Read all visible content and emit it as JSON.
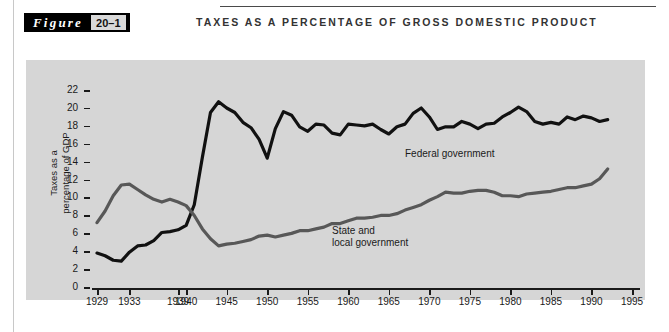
{
  "figure": {
    "word": "Figure",
    "number": "20–1",
    "title": "TAXES AS A PERCENTAGE OF GROSS DOMESTIC PRODUCT"
  },
  "colors": {
    "panel_background": "#d6d6d6",
    "federal_line": "#111111",
    "state_local_line": "#585858",
    "axis": "#1a1a1a",
    "tag_background": "#000000",
    "tag_number_background": "#d9d9d9"
  },
  "chart_data": {
    "type": "line",
    "title": "Taxes as a Percentage of Gross Domestic Product",
    "xlabel": "",
    "ylabel": "Taxes as a percentage of GDP",
    "ylabel_lines": [
      "Taxes as a",
      "percentage of GDP"
    ],
    "xlim": [
      1929,
      1995
    ],
    "ylim": [
      0,
      22
    ],
    "ytick_values": [
      0,
      2,
      4,
      6,
      8,
      10,
      12,
      14,
      16,
      18,
      20,
      22
    ],
    "ytick_labels": [
      "0",
      "2",
      "4",
      "6",
      "8",
      "10",
      "12",
      "14",
      "16",
      "18",
      "20",
      "22"
    ],
    "xtick_values": [
      1929,
      1933,
      1939,
      1940,
      1945,
      1950,
      1955,
      1960,
      1965,
      1970,
      1975,
      1980,
      1985,
      1990,
      1995
    ],
    "xtick_labels": [
      "1929",
      "1933",
      "1939",
      "1940",
      "1945",
      "1950",
      "1955",
      "1960",
      "1965",
      "1970",
      "1975",
      "1980",
      "1985",
      "1990",
      "1995"
    ],
    "grid": false,
    "legend_position": "inline-annotation",
    "series": [
      {
        "name": "Federal government",
        "color": "#111111",
        "label_x": 1967,
        "label_y": 15.6,
        "x": [
          1929,
          1930,
          1931,
          1932,
          1933,
          1934,
          1935,
          1936,
          1937,
          1938,
          1939,
          1940,
          1941,
          1942,
          1943,
          1944,
          1945,
          1946,
          1947,
          1948,
          1949,
          1950,
          1951,
          1952,
          1953,
          1954,
          1955,
          1956,
          1957,
          1958,
          1959,
          1960,
          1961,
          1962,
          1963,
          1964,
          1965,
          1966,
          1967,
          1968,
          1969,
          1970,
          1971,
          1972,
          1973,
          1974,
          1975,
          1976,
          1977,
          1978,
          1979,
          1980,
          1981,
          1982,
          1983,
          1984,
          1985,
          1986,
          1987,
          1988,
          1989,
          1990,
          1991,
          1992
        ],
        "values": [
          3.9,
          3.6,
          3.1,
          3.0,
          4.0,
          4.7,
          4.8,
          5.3,
          6.2,
          6.3,
          6.5,
          7.0,
          9.3,
          14.6,
          19.6,
          20.8,
          20.1,
          19.6,
          18.5,
          17.9,
          16.6,
          14.5,
          17.8,
          19.7,
          19.3,
          18.0,
          17.5,
          18.3,
          18.2,
          17.3,
          17.1,
          18.3,
          18.2,
          18.1,
          18.3,
          17.7,
          17.2,
          18.0,
          18.3,
          19.5,
          20.1,
          19.1,
          17.7,
          18.0,
          18.0,
          18.6,
          18.3,
          17.8,
          18.3,
          18.4,
          19.1,
          19.6,
          20.2,
          19.7,
          18.6,
          18.3,
          18.5,
          18.3,
          19.1,
          18.8,
          19.2,
          19.0,
          18.6,
          18.8
        ]
      },
      {
        "name": "State and local government",
        "color": "#585858",
        "label_x": 1958,
        "label_y": 7.0,
        "label_lines": [
          "State and",
          "local government"
        ],
        "x": [
          1929,
          1930,
          1931,
          1932,
          1933,
          1934,
          1935,
          1936,
          1937,
          1938,
          1939,
          1940,
          1941,
          1942,
          1943,
          1944,
          1945,
          1946,
          1947,
          1948,
          1949,
          1950,
          1951,
          1952,
          1953,
          1954,
          1955,
          1956,
          1957,
          1958,
          1959,
          1960,
          1961,
          1962,
          1963,
          1964,
          1965,
          1966,
          1967,
          1968,
          1969,
          1970,
          1971,
          1972,
          1973,
          1974,
          1975,
          1976,
          1977,
          1978,
          1979,
          1980,
          1981,
          1982,
          1983,
          1984,
          1985,
          1986,
          1987,
          1988,
          1989,
          1990,
          1991,
          1992
        ],
        "values": [
          7.3,
          8.6,
          10.3,
          11.5,
          11.6,
          11.0,
          10.4,
          9.9,
          9.6,
          9.9,
          9.6,
          9.2,
          8.1,
          6.6,
          5.5,
          4.7,
          4.9,
          5.0,
          5.2,
          5.4,
          5.8,
          5.9,
          5.7,
          5.9,
          6.1,
          6.4,
          6.4,
          6.6,
          6.8,
          7.2,
          7.2,
          7.5,
          7.8,
          7.8,
          7.9,
          8.1,
          8.1,
          8.3,
          8.7,
          9.0,
          9.3,
          9.8,
          10.2,
          10.7,
          10.6,
          10.6,
          10.8,
          10.9,
          10.9,
          10.7,
          10.3,
          10.3,
          10.2,
          10.5,
          10.6,
          10.7,
          10.8,
          11.0,
          11.2,
          11.2,
          11.4,
          11.6,
          12.2,
          13.3
        ]
      }
    ]
  }
}
